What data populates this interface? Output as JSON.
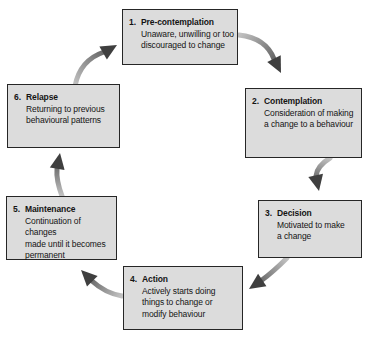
{
  "diagram": {
    "type": "cycle-flow-diagram",
    "boxes": [
      {
        "number": "1.",
        "title": "Pre-contemplation",
        "description": "Unaware, unwilling or too\ndiscouraged to change"
      },
      {
        "number": "2.",
        "title": "Contemplation",
        "description": "Consideration of making\na change to a behaviour"
      },
      {
        "number": "3.",
        "title": "Decision",
        "description": "Motivated to make\na change"
      },
      {
        "number": "4.",
        "title": "Action",
        "description": "Actively starts doing\nthings to change or\nmodify behaviour"
      },
      {
        "number": "5.",
        "title": "Maintenance",
        "description": "Continuation of changes\nmade until it becomes\npermanent"
      },
      {
        "number": "6.",
        "title": "Relapse",
        "description": "Returning to previous\nbehavioural patterns"
      }
    ],
    "arrows": [
      {
        "from": "Pre-contemplation",
        "to": "Contemplation"
      },
      {
        "from": "Contemplation",
        "to": "Decision"
      },
      {
        "from": "Decision",
        "to": "Action"
      },
      {
        "from": "Action",
        "to": "Maintenance"
      },
      {
        "from": "Maintenance",
        "to": "Relapse"
      },
      {
        "from": "Relapse",
        "to": "Pre-contemplation"
      }
    ],
    "colors": {
      "background": "#ffffff",
      "box_fill": "#dcdcdc",
      "box_border": "#262626",
      "text": "#141414",
      "arrow_tail": "#c3c3c3",
      "arrow_head": "#3f3f3f"
    }
  }
}
